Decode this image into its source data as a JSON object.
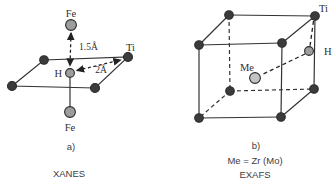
{
  "figure": {
    "left_panel": {
      "label": "a)",
      "method": "XANES",
      "atoms": {
        "fe_top": "Fe",
        "fe_bottom": "Fe",
        "hydrogen": "H",
        "titanium": "Ti"
      },
      "distances": {
        "fe_h": "1.5Å",
        "ti_h": "2Å"
      }
    },
    "right_panel": {
      "label": "b)",
      "method": "EXAFS",
      "note": "Me = Zr (Mo)",
      "atoms": {
        "titanium": "Ti",
        "hydrogen": "H",
        "metal": "Me"
      }
    },
    "colors": {
      "dark_atom": "#3b3b3b",
      "gray_atom": "#9d9d9d",
      "me_atom": "#c3c3c3",
      "line": "#333333",
      "text": "#2f2f2f",
      "background": "#ffffff"
    }
  }
}
